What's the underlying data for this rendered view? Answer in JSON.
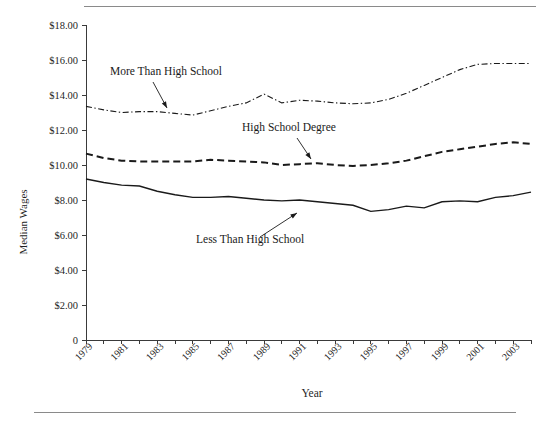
{
  "figure": {
    "rule_color": "#8a8a8a",
    "background": "#ffffff",
    "line_color": "#1a1a1a"
  },
  "chart_data": {
    "type": "line",
    "title": "",
    "xlabel": "Year",
    "ylabel": "Median Wages",
    "xlim": [
      1979,
      2004
    ],
    "ylim": [
      0,
      18
    ],
    "grid": false,
    "legend_position": "inline-annotations",
    "ytick_labels": [
      "0",
      "$2.00",
      "$4.00",
      "$6.00",
      "$8.00",
      "$10.00",
      "$12.00",
      "$14.00",
      "$16.00",
      "$18.00"
    ],
    "ytick_values": [
      0,
      2,
      4,
      6,
      8,
      10,
      12,
      14,
      16,
      18
    ],
    "xtick_labels": [
      "1979",
      "1981",
      "1983",
      "1985",
      "1987",
      "1989",
      "1991",
      "1993",
      "1995",
      "1997",
      "1999",
      "2001",
      "2003"
    ],
    "xtick_values": [
      1979,
      1981,
      1983,
      1985,
      1987,
      1989,
      1991,
      1993,
      1995,
      1997,
      1999,
      2001,
      2003
    ],
    "x": [
      1979,
      1980,
      1981,
      1982,
      1983,
      1984,
      1985,
      1986,
      1987,
      1988,
      1989,
      1990,
      1991,
      1992,
      1993,
      1994,
      1995,
      1996,
      1997,
      1998,
      1999,
      2000,
      2001,
      2002,
      2003,
      2004
    ],
    "series": [
      {
        "name": "More Than High School",
        "dash": "dash-dot",
        "values": [
          13.35,
          13.15,
          13.0,
          13.05,
          13.05,
          12.95,
          12.85,
          13.1,
          13.35,
          13.55,
          14.05,
          13.55,
          13.7,
          13.65,
          13.55,
          13.5,
          13.55,
          13.75,
          14.1,
          14.55,
          15.0,
          15.45,
          15.75,
          15.8,
          15.8,
          15.8
        ]
      },
      {
        "name": "High School Degree",
        "dash": "dashed",
        "values": [
          10.65,
          10.4,
          10.25,
          10.2,
          10.2,
          10.2,
          10.2,
          10.3,
          10.25,
          10.2,
          10.15,
          10.0,
          10.05,
          10.1,
          10.0,
          9.95,
          10.0,
          10.1,
          10.25,
          10.5,
          10.75,
          10.9,
          11.05,
          11.2,
          11.3,
          11.2
        ]
      },
      {
        "name": "Less Than High School",
        "dash": "solid",
        "values": [
          9.2,
          9.0,
          8.85,
          8.8,
          8.5,
          8.3,
          8.15,
          8.15,
          8.2,
          8.1,
          8.0,
          7.95,
          8.0,
          7.9,
          7.8,
          7.7,
          7.35,
          7.45,
          7.65,
          7.55,
          7.9,
          7.95,
          7.9,
          8.15,
          8.25,
          8.45
        ]
      }
    ],
    "annotations": [
      {
        "text": "More Than High School",
        "label_x": 110,
        "label_y": 75,
        "arrow_from_x": 153,
        "arrow_from_y": 82,
        "arrow_to_x": 167,
        "arrow_to_y": 108
      },
      {
        "text": "High School Degree",
        "label_x": 242,
        "label_y": 131,
        "arrow_from_x": 297,
        "arrow_from_y": 138,
        "arrow_to_x": 311,
        "arrow_to_y": 159
      },
      {
        "text": "Less Than High School",
        "label_x": 196,
        "label_y": 243,
        "arrow_from_x": 260,
        "arrow_from_y": 237,
        "arrow_to_x": 297,
        "arrow_to_y": 213
      }
    ]
  }
}
